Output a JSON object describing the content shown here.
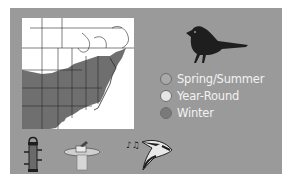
{
  "card": {
    "background": "#9a9a9a",
    "map": {
      "label": "range-map-eastern-north-america",
      "range_fill": "#6f6f6f"
    },
    "bird_silhouette": "songbird-silhouette",
    "legend": [
      {
        "label": "Spring/Summer",
        "color": "#a9a9a9"
      },
      {
        "label": "Year-Round",
        "color": "#e6e6e6"
      },
      {
        "label": "Winter",
        "color": "#7a7a7a"
      }
    ],
    "feeding_icons": [
      "tube-feeder-icon",
      "bird-bath-icon",
      "bird-song-icon"
    ]
  }
}
